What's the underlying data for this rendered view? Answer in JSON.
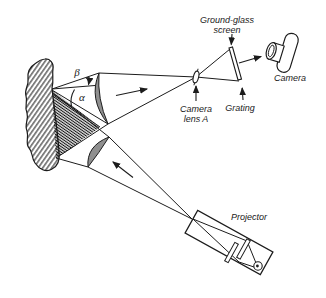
{
  "diagram": {
    "title_context": "projection moire optical setup",
    "labels": {
      "ground_glass_line1": "Ground-glass",
      "ground_glass_line2": "screen",
      "camera": "Camera",
      "camera_lens_line1": "Camera",
      "camera_lens_line2": "lens A",
      "grating": "Grating",
      "projector": "Projector",
      "angle_beta": "β",
      "angle_alpha": "α"
    },
    "colors": {
      "line": "#1c1c1c",
      "lens_fill": "#8f8f8f",
      "background": "#ffffff"
    }
  }
}
